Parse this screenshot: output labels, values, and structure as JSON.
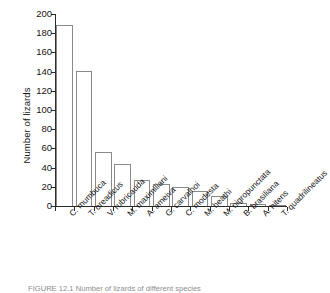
{
  "figure": {
    "caption": "FIGURE 12.1   Number of lizards of different species"
  },
  "chart_data": {
    "type": "bar",
    "title": "",
    "xlabel": "",
    "ylabel": "Number of lizards",
    "ylim": [
      0,
      200
    ],
    "yticks": [
      0,
      20,
      40,
      60,
      80,
      100,
      120,
      140,
      160,
      180,
      200
    ],
    "grid": false,
    "legend": null,
    "categories": [
      "C. mumbuca",
      "T. oreadicus",
      "V. rubricauda",
      "M. maximiliani",
      "A. ameiva",
      "G. carvalhoi",
      "C. modesta",
      "M. heathi",
      "M. nigropunctata",
      "B. brasiliana",
      "A. nitens",
      "T. quadrilineatus"
    ],
    "values": [
      189,
      141,
      56,
      44,
      27,
      23,
      20,
      16,
      10,
      3,
      2,
      1
    ]
  }
}
